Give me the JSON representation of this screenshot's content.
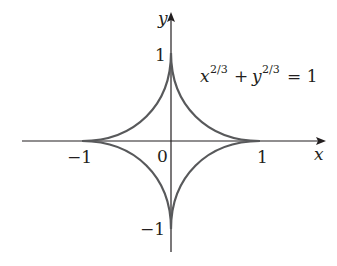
{
  "figure": {
    "type": "astroid curve plot",
    "equation": {
      "base_x": "x",
      "exp_x": "2/3",
      "plus": "+",
      "base_y": "y",
      "exp_y": "2/3",
      "equals": "= 1"
    },
    "axes": {
      "x_label": "x",
      "y_label": "y",
      "origin_label": "0",
      "x_ticks": [
        "−1",
        "1"
      ],
      "y_ticks": [
        "1",
        "−1"
      ]
    },
    "colors": {
      "curve": "#58595b",
      "axis": "#231f20",
      "text": "#231f20"
    }
  }
}
